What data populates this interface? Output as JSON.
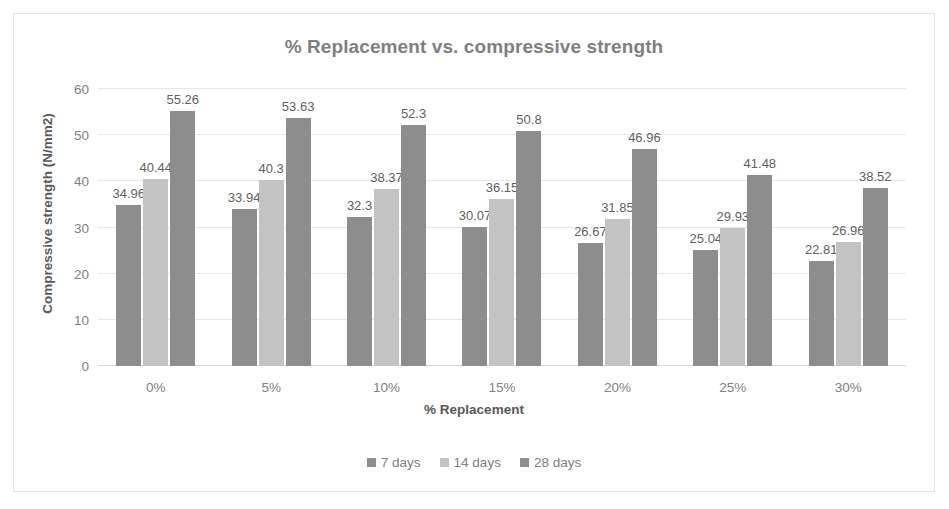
{
  "chart_data": {
    "type": "bar",
    "title": "% Replacement vs. compressive strength",
    "xlabel": "% Replacement",
    "ylabel": "Compressive strength (N/mm2)",
    "categories": [
      "0%",
      "5%",
      "10%",
      "15%",
      "20%",
      "25%",
      "30%"
    ],
    "series": [
      {
        "name": "7 days",
        "color": "#8d8d8d",
        "values": [
          34.96,
          33.94,
          32.3,
          30.07,
          26.67,
          25.04,
          22.81
        ],
        "labels": [
          "34.96",
          "33.94",
          "32.3",
          "30.07",
          "26.67",
          "25.04",
          "22.81"
        ]
      },
      {
        "name": "14 days",
        "color": "#c3c3c3",
        "values": [
          40.44,
          40.3,
          38.37,
          36.15,
          31.85,
          29.93,
          26.96
        ],
        "labels": [
          "40.44",
          "40.3",
          "38.37",
          "36.15",
          "31.85",
          "29.93",
          "26.96"
        ]
      },
      {
        "name": "28 days",
        "color": "#8d8d8d",
        "values": [
          55.26,
          53.63,
          52.3,
          50.8,
          46.96,
          41.48,
          38.52
        ],
        "labels": [
          "55.26",
          "53.63",
          "52.3",
          "50.8",
          "46.96",
          "41.48",
          "38.52"
        ]
      }
    ],
    "ylim": [
      0,
      60
    ],
    "yticks": [
      0,
      10,
      20,
      30,
      40,
      50,
      60
    ],
    "ytick_labels": [
      "0",
      "10",
      "20",
      "30",
      "40",
      "50",
      "60"
    ],
    "grid": true,
    "legend_position": "bottom",
    "data_labels": true
  },
  "colors": {
    "title": "#7f7f7f",
    "axis_text": "#808080",
    "axis_title": "#595959",
    "gridline": "#e6e6e6",
    "frame_border": "#e3e3e3",
    "background": "#ffffff"
  }
}
